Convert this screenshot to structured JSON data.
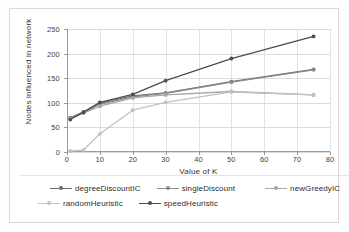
{
  "chart_data": {
    "type": "line",
    "title": "",
    "subtitle": "",
    "xlabel": "Value of K",
    "ylabel": "Nodes influenced in network",
    "x": [
      1,
      5,
      10,
      20,
      30,
      50,
      75
    ],
    "xlim": [
      0,
      80
    ],
    "ylim": [
      0,
      250
    ],
    "xticks": [
      0,
      10,
      20,
      30,
      40,
      50,
      60,
      70,
      80
    ],
    "yticks": [
      0,
      50,
      100,
      150,
      200,
      250
    ],
    "grid": true,
    "legend_position": "bottom",
    "series": [
      {
        "name": "degreeDiscountIC",
        "color": "#6b6b6b",
        "marker": "circle",
        "values": [
          70,
          81,
          99,
          114,
          120,
          143,
          168
        ]
      },
      {
        "name": "singleDiscount",
        "color": "#8c8c8c",
        "marker": "circle",
        "values": [
          69,
          80,
          97,
          112,
          119,
          142,
          167
        ]
      },
      {
        "name": "newGreedyIC",
        "color": "#a6a6a6",
        "marker": "circle",
        "values": [
          68,
          79,
          93,
          110,
          116,
          123,
          116
        ]
      },
      {
        "name": "randomHeuristic",
        "color": "#c2c2c2",
        "marker": "circle",
        "values": [
          2,
          4,
          37,
          85,
          101,
          122,
          116
        ]
      },
      {
        "name": "speedHeuristic",
        "color": "#4d4d4d",
        "marker": "circle",
        "values": [
          66,
          81,
          101,
          117,
          145,
          190,
          235
        ]
      }
    ]
  },
  "axes": {
    "y_tick_labels": [
      "0",
      "50",
      "100",
      "150",
      "200",
      "250"
    ],
    "x_tick_labels": [
      "0",
      "10",
      "20",
      "30",
      "40",
      "50",
      "60",
      "70",
      "80"
    ],
    "x_axis_title": "Value of K",
    "y_axis_title": "Nodes influenced in network"
  },
  "legend": {
    "row1": [
      {
        "label": "degreeDiscountIC",
        "color": "#6b6b6b"
      },
      {
        "label": "singleDiscount",
        "color": "#8c8c8c"
      },
      {
        "label": "newGreedyIC",
        "color": "#a6a6a6"
      }
    ],
    "row2": [
      {
        "label": "randomHeuristic",
        "color": "#c2c2c2"
      },
      {
        "label": "speedHeuristic",
        "color": "#4d4d4d"
      }
    ]
  }
}
